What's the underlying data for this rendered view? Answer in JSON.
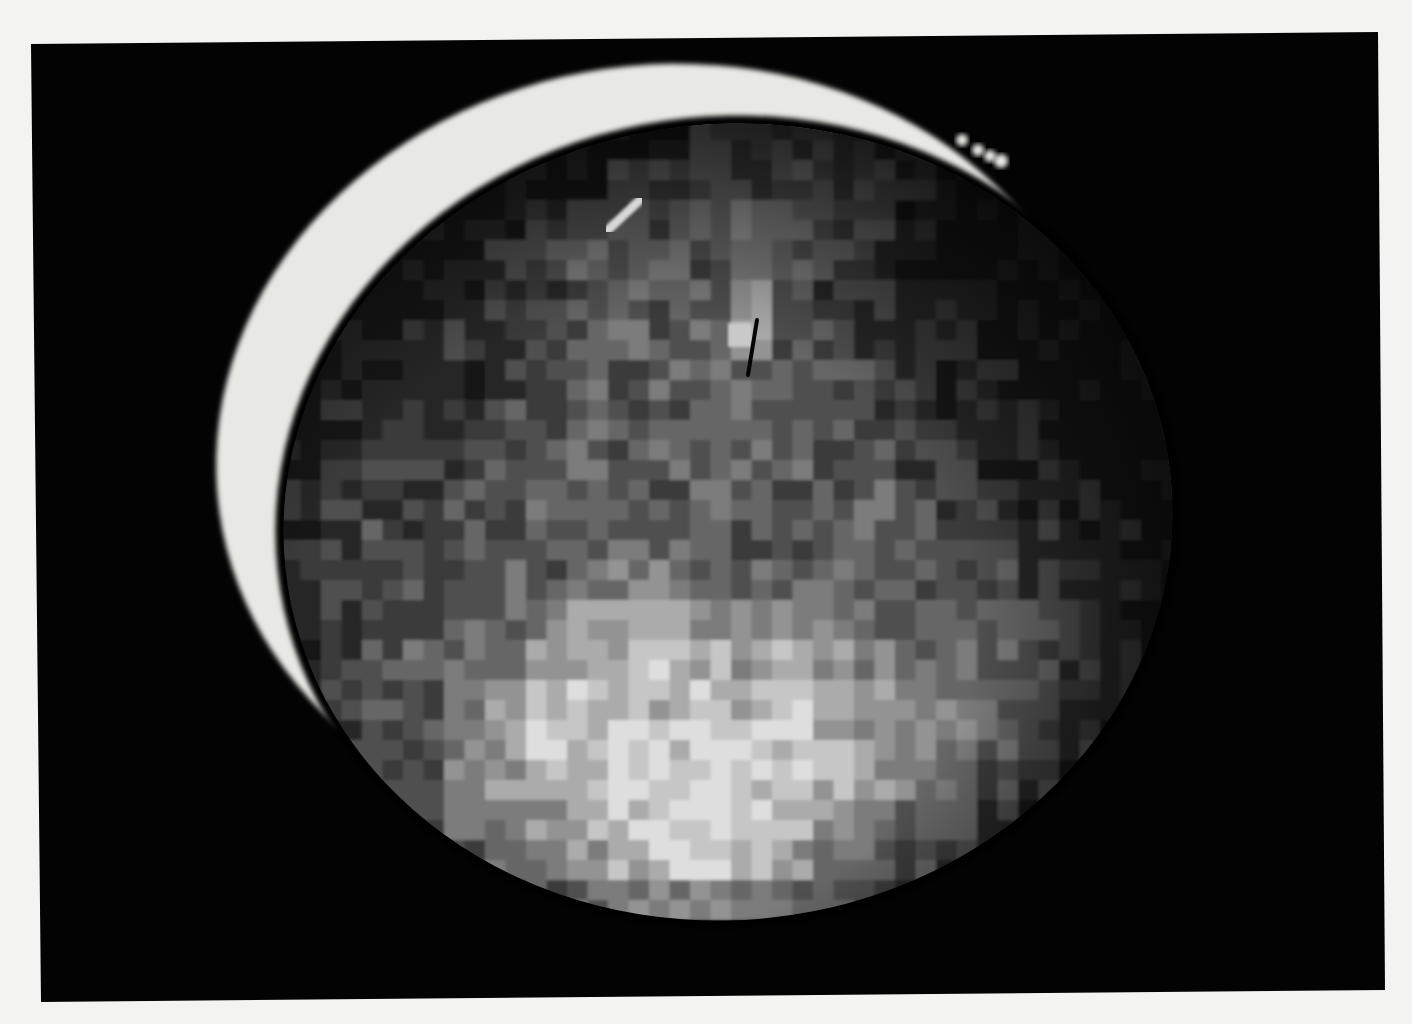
{
  "image": {
    "subject": "Pixelated grayscale photograph of a planet showing a bright crescent limb and a mottled disc",
    "page_background": "#f3f3f1",
    "frame": {
      "color": "#030303",
      "corners": [
        [
          31,
          44
        ],
        [
          1378,
          32
        ],
        [
          1385,
          990
        ],
        [
          41,
          1002
        ]
      ]
    },
    "crescent": {
      "color": "#e8e8e4",
      "outer": {
        "cx": 660,
        "cy": 450,
        "rx": 445,
        "ry": 385,
        "rotate": -8
      },
      "tail_dots": [
        [
          962,
          140,
          6
        ],
        [
          978,
          150,
          6
        ],
        [
          990,
          156,
          6
        ],
        [
          1001,
          161,
          7
        ]
      ],
      "bottom_tip": [
        340,
        785
      ]
    },
    "disc": {
      "cx": 728,
      "cy": 522,
      "rx": 445,
      "ry": 398,
      "rotate": -6,
      "base_color": "#111111",
      "grid": {
        "x0": 280,
        "y0": 120,
        "cell_w": 41,
        "cell_h": 40,
        "rows": [
          "0000000000333322000000",
          "0000000033434332100000",
          "0000002343454331000000",
          "0000023434364321000000",
          "0000122343463221100000",
          "0001212343473321100000",
          "0012123434444332110000",
          "0112233433443322111000",
          "0122233434344332211000",
          "1222334343433343221100",
          "1232334444433343322110",
          "1233343555444433332110",
          "1233445667656544433210",
          "1234456778767654443210",
          "1233567887878765543210",
          "0233568898988766543210",
          "0223567898988765432100",
          "0022456788987654321000",
          "0001345678876543210000",
          "0000023455654320000000"
        ],
        "palette": [
          "#121212",
          "#262626",
          "#3a3a3a",
          "#505050",
          "#666666",
          "#7c7c7c",
          "#939393",
          "#ababab",
          "#c6c6c6",
          "#dedede"
        ]
      },
      "features": {
        "bright_spot": [
          740,
          335
        ],
        "dark_streak": [
          [
            757,
            320
          ],
          [
            748,
            375
          ]
        ],
        "bright_streak_upper_left": [
          [
            640,
            200
          ],
          [
            608,
            230
          ]
        ]
      }
    }
  }
}
